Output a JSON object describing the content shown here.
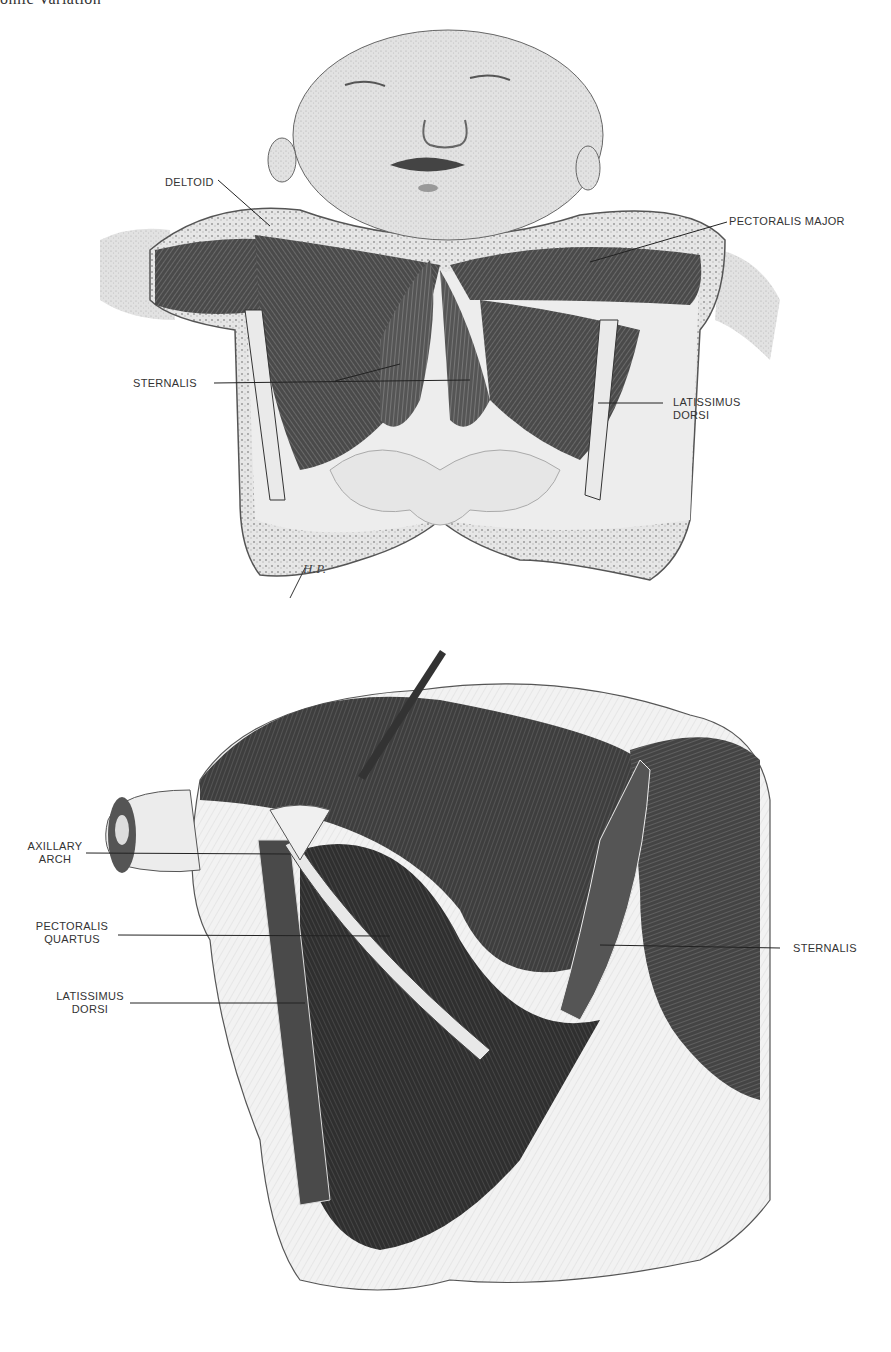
{
  "page": {
    "running_header": "omic Variation",
    "background": "#ffffff"
  },
  "figure_top": {
    "description": "Infant thorax dissection, anterior view",
    "signature": "H.P.",
    "labels": {
      "deltoid": "DELTOID",
      "pectoralis_major": "PECTORALIS MAJOR",
      "sternalis": "STERNALIS",
      "latissimus_dorsi": "LATISSIMUS\nDORSI"
    }
  },
  "figure_bottom": {
    "description": "Adult thorax dissection, anterolateral view",
    "labels": {
      "axillary_arch": "AXILLARY\nARCH",
      "pectoralis_quartus": "PECTORALIS\nQUARTUS",
      "latissimus_dorsi": "LATISSIMUS\nDORSI",
      "sternalis": "STERNALIS"
    }
  }
}
